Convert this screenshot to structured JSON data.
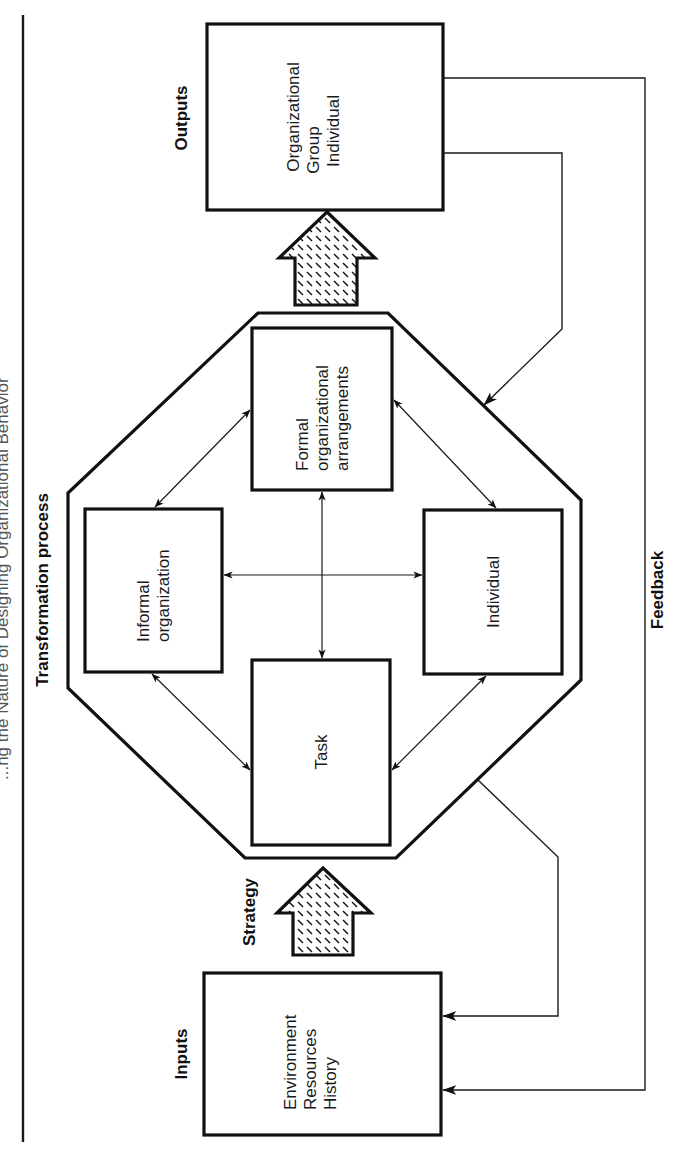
{
  "figure": {
    "title_partial": "...ng the Nature of Designing Organizational Behavior",
    "orientation": "rotated 90° counter-clockwise (text reads bottom-to-top)",
    "colors": {
      "ink": "#111111",
      "background": "#ffffff"
    }
  },
  "labels": {
    "inputs": "Inputs",
    "strategy": "Strategy",
    "transformation_process": "Transformation process",
    "outputs": "Outputs",
    "feedback": "Feedback"
  },
  "inputs_box": {
    "lines": [
      "Environment",
      "Resources",
      "History"
    ]
  },
  "outputs_box": {
    "lines": [
      "Organizational",
      "Group",
      "Individual"
    ]
  },
  "components": {
    "task": {
      "lines": [
        "Task"
      ]
    },
    "informal": {
      "lines": [
        "Informal",
        "organization"
      ]
    },
    "formal": {
      "lines": [
        "Formal",
        "organizational",
        "arrangements"
      ]
    },
    "individual": {
      "lines": [
        "Individual"
      ]
    }
  },
  "relationships": [
    {
      "from": "Task",
      "to": "Informal organization",
      "type": "bidirectional"
    },
    {
      "from": "Task",
      "to": "Formal organizational arrangements",
      "type": "bidirectional"
    },
    {
      "from": "Task",
      "to": "Individual",
      "type": "bidirectional"
    },
    {
      "from": "Informal organization",
      "to": "Formal organizational arrangements",
      "type": "bidirectional"
    },
    {
      "from": "Informal organization",
      "to": "Individual",
      "type": "bidirectional"
    },
    {
      "from": "Formal organizational arrangements",
      "to": "Individual",
      "type": "bidirectional"
    }
  ],
  "flows": [
    {
      "from": "Inputs",
      "to": "Transformation process",
      "label": "Strategy"
    },
    {
      "from": "Transformation process",
      "to": "Outputs",
      "label": ""
    },
    {
      "from": "Outputs",
      "to": "Transformation process",
      "label": "Feedback"
    },
    {
      "from": "Outputs",
      "to": "Inputs",
      "label": "Feedback"
    },
    {
      "from": "Transformation process",
      "to": "Inputs",
      "label": "Feedback"
    }
  ]
}
